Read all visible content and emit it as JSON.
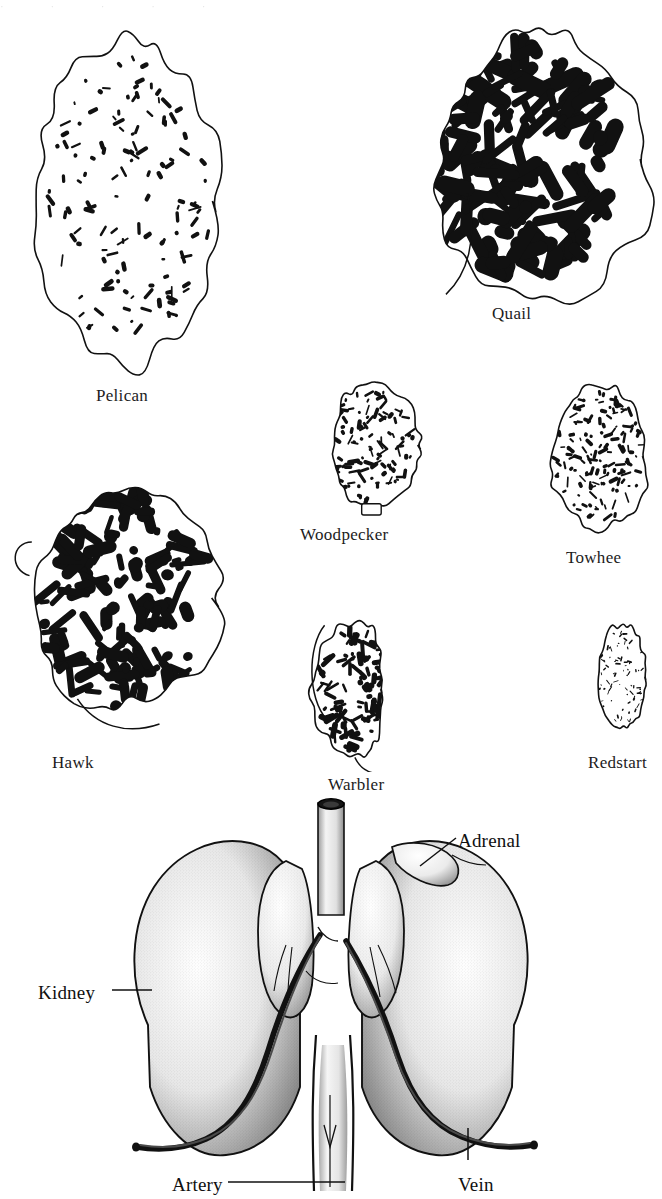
{
  "figure": {
    "page_top_artifact": "·  ·  ·  ·  ·",
    "background_color": "#ffffff",
    "ink_color": "#111111"
  },
  "sections": {
    "caption_note": "Cross sections of kidneys of various birds showing extent of medullary (dark) tissue",
    "items": [
      {
        "id": "pelican",
        "label": "Pelican",
        "medulla_density": "very sparse",
        "shape": "elongate rectangular slab",
        "label_x": 96,
        "label_y": 386,
        "draw_x": 14,
        "draw_y": 18,
        "draw_w": 222,
        "draw_h": 360,
        "seed": 11,
        "blob_count": 128,
        "blob_scale": 0.55
      },
      {
        "id": "quail",
        "label": "Quail",
        "medulla_density": "very dense",
        "shape": "irregular triangular with lobed lower right",
        "label_x": 492,
        "label_y": 304,
        "draw_x": 384,
        "draw_y": 12,
        "draw_w": 268,
        "draw_h": 288,
        "seed": 27,
        "blob_count": 150,
        "blob_scale": 1.65
      },
      {
        "id": "hawk",
        "label": "Hawk",
        "medulla_density": "dense",
        "shape": "rounded ovoid with apical process",
        "label_x": 52,
        "label_y": 753,
        "draw_x": 6,
        "draw_y": 455,
        "draw_w": 228,
        "draw_h": 280,
        "seed": 43,
        "blob_count": 140,
        "blob_scale": 1.45
      },
      {
        "id": "woodpecker",
        "label": "Woodpecker",
        "medulla_density": "moderate",
        "shape": "triangular with basal notch",
        "label_x": 300,
        "label_y": 525,
        "draw_x": 305,
        "draw_y": 372,
        "draw_w": 122,
        "draw_h": 140,
        "seed": 59,
        "blob_count": 110,
        "blob_scale": 0.95
      },
      {
        "id": "towhee",
        "label": "Towhee",
        "medulla_density": "moderately dense",
        "shape": "rounded oblong",
        "label_x": 566,
        "label_y": 548,
        "draw_x": 536,
        "draw_y": 372,
        "draw_w": 120,
        "draw_h": 162,
        "seed": 71,
        "blob_count": 135,
        "blob_scale": 0.85
      },
      {
        "id": "warbler",
        "label": "Warbler",
        "medulla_density": "dense",
        "shape": "club shaped with tapering apex",
        "label_x": 328,
        "label_y": 775,
        "draw_x": 300,
        "draw_y": 610,
        "draw_w": 108,
        "draw_h": 152,
        "seed": 83,
        "blob_count": 100,
        "blob_scale": 1.5
      },
      {
        "id": "redstart",
        "label": "Redstart",
        "medulla_density": "moderate",
        "shape": "small ovoid",
        "label_x": 588,
        "label_y": 753,
        "draw_x": 586,
        "draw_y": 615,
        "draw_w": 66,
        "draw_h": 118,
        "seed": 97,
        "blob_count": 80,
        "blob_scale": 0.75
      }
    ]
  },
  "anatomy": {
    "id": "gross-kidney-diagram",
    "description": "Ventral view of paired kidneys with adrenal glands, renal artery and vein, and cut aorta stump",
    "labels": [
      {
        "id": "kidney",
        "text": "Kidney",
        "x": 38,
        "y": 982,
        "anchor": "left"
      },
      {
        "id": "adrenal",
        "text": "Adrenal",
        "x": 458,
        "y": 830,
        "anchor": "left"
      },
      {
        "id": "artery",
        "text": "Artery",
        "x": 172,
        "y": 1174,
        "anchor": "left"
      },
      {
        "id": "vein",
        "text": "Vein",
        "x": 458,
        "y": 1174,
        "anchor": "left"
      }
    ],
    "leaders": [
      {
        "id": "kidney-leader",
        "x1": 112,
        "y1": 990,
        "x2": 152,
        "y2": 990
      },
      {
        "id": "adrenal-leader",
        "x1": 456,
        "y1": 838,
        "x2": 420,
        "y2": 866
      },
      {
        "id": "artery-leader",
        "x1": 228,
        "y1": 1182,
        "x2": 345,
        "y2": 1182
      },
      {
        "id": "vein-leader",
        "x1": 468,
        "y1": 1160,
        "x2": 468,
        "y2": 1128
      }
    ]
  }
}
